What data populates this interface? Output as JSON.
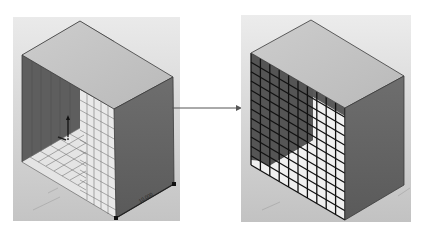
{
  "diagram": {
    "left_panel": {
      "label": "before",
      "dimension_text": "10.000"
    },
    "arrow": {
      "direction": "right"
    },
    "right_panel": {
      "label": "after",
      "grid_columns": 10,
      "grid_rows": 12
    },
    "colors": {
      "background_panel": "#d4d4d4",
      "top_face": "#c8c8c8",
      "dark_face": "#5c5c5c",
      "side_face": "#6a6a6a",
      "light_cell": "#efefef",
      "grid_line": "#1a1a1a",
      "arrow": "#555555"
    }
  }
}
